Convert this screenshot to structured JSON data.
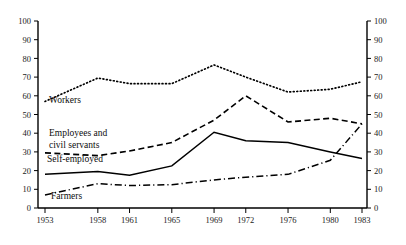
{
  "figure": {
    "caption_fragment": "",
    "background": "#ffffff",
    "ink": "#000000"
  },
  "chart_data": {
    "type": "line",
    "title": "",
    "subtitle": "",
    "xlabel": "",
    "ylabel": "",
    "x": [
      1953,
      1958,
      1961,
      1965,
      1969,
      1972,
      1976,
      1980,
      1983
    ],
    "categories": [
      "1953",
      "1958",
      "1961",
      "1965",
      "1969",
      "1972",
      "1976",
      "1980",
      "1983"
    ],
    "xlim": [
      1953,
      1983
    ],
    "ylim": [
      0,
      100
    ],
    "yticks": [
      0,
      10,
      20,
      30,
      40,
      50,
      60,
      70,
      80,
      90,
      100
    ],
    "ytick_labels": [
      "0",
      "10",
      "20",
      "30",
      "40",
      "50",
      "60",
      "70",
      "80",
      "90",
      "100"
    ],
    "grid": false,
    "legend_position": "inline-labels",
    "dual_y_axis": true,
    "right_axis": {
      "ticks": [
        0,
        10,
        20,
        30,
        40,
        50,
        60,
        70,
        80,
        90,
        100
      ],
      "labels": [
        "0",
        "10",
        "20",
        "30",
        "40",
        "50",
        "60",
        "70",
        "80",
        "90",
        "100"
      ]
    },
    "series": [
      {
        "name": "Workers",
        "label": "Workers",
        "style": "dotted",
        "color": "#000000",
        "values": [
          57,
          69.5,
          66.5,
          66.5,
          76.5,
          70,
          62,
          63.5,
          67.5
        ]
      },
      {
        "name": "Employees and civil servants",
        "label": "Employees and",
        "label_line2": "civil servants",
        "style": "dashed",
        "color": "#000000",
        "values": [
          29.5,
          28,
          30.5,
          35,
          47,
          60,
          46,
          48,
          45
        ]
      },
      {
        "name": "Self-employed",
        "label": "Self-employed",
        "style": "solid",
        "color": "#000000",
        "values": [
          18,
          19.5,
          17.5,
          22.5,
          40.5,
          36,
          35,
          30,
          26.5
        ]
      },
      {
        "name": "Farmers",
        "label": "Farmers",
        "style": "dashdot",
        "color": "#000000",
        "values": [
          7,
          13,
          12,
          12.5,
          15,
          16.5,
          18,
          25.5,
          45
        ]
      }
    ]
  }
}
